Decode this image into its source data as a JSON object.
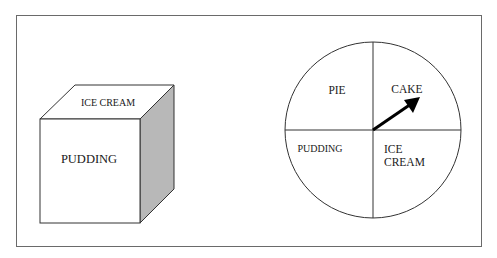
{
  "figure": {
    "cube": {
      "top_face_label": "ICE CREAM",
      "front_face_label": "PUDDING",
      "side_face_color": "#b8b8b8"
    },
    "spinner": {
      "sections": [
        {
          "label": "PIE",
          "quadrant": "top-left"
        },
        {
          "label": "CAKE",
          "quadrant": "top-right"
        },
        {
          "label": "PUDDING",
          "quadrant": "bottom-left"
        },
        {
          "label": "ICE",
          "label_line2": "CREAM",
          "quadrant": "bottom-right"
        }
      ],
      "pointer_points_to": "CAKE"
    },
    "colors": {
      "line": "#333333",
      "frame": "#666666"
    }
  }
}
